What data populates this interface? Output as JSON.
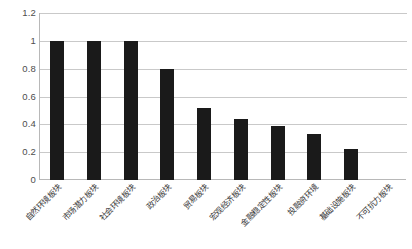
{
  "chart_data": {
    "type": "bar",
    "title": "",
    "xlabel": "",
    "ylabel": "",
    "ylim": [
      0,
      1.2
    ],
    "grid": true,
    "legend": "none",
    "bar_color": "#1a1a1a",
    "grid_color": "#c9c9c9",
    "axis_color": "#b8b8b8",
    "tick_label_color": "#4d4d4d",
    "yticks": [
      "0",
      "0.2",
      "0.4",
      "0.6",
      "0.8",
      "1",
      "1.2"
    ],
    "ytick_values": [
      0,
      0.2,
      0.4,
      0.6,
      0.8,
      1,
      1.2
    ],
    "categories": [
      "自然环境板块",
      "市场潜力板块",
      "社会环境板块",
      "政治板块",
      "贸易板块",
      "宏观经济板块",
      "金融稳定性板块",
      "投融资环境",
      "基础设施板块",
      "不可抗力板块"
    ],
    "values": [
      1,
      1,
      1,
      0.8,
      0.52,
      0.44,
      0.39,
      0.33,
      0.22,
      0
    ]
  }
}
